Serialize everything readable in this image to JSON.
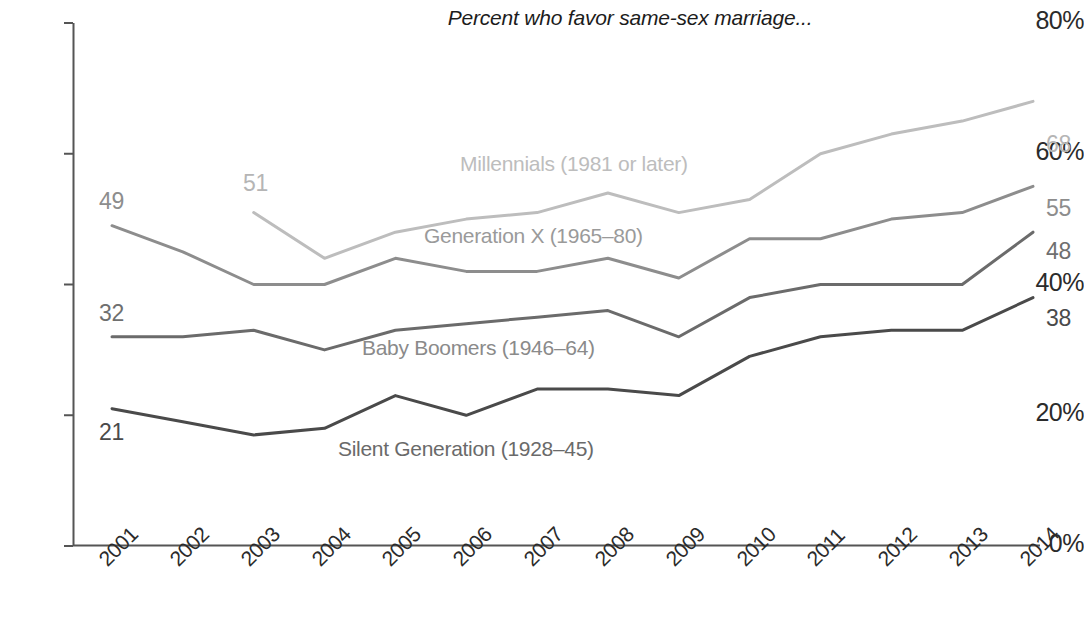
{
  "chart_data": {
    "type": "line",
    "title": "Percent who favor same-sex marriage...",
    "xlabel": "",
    "ylabel": "",
    "ylim": [
      0,
      80
    ],
    "grid": false,
    "legend_position": "inline-labels",
    "categories": [
      "2001",
      "2002",
      "2003",
      "2004",
      "2005",
      "2006",
      "2007",
      "2008",
      "2009",
      "2010",
      "2011",
      "2012",
      "2013",
      "2014"
    ],
    "y_ticks": [
      "0%",
      "20%",
      "40%",
      "60%",
      "80%"
    ],
    "y_tick_values": [
      0,
      20,
      40,
      60,
      80
    ],
    "series": [
      {
        "name": "Millennials (1981 or later)",
        "color": "#bdbdbd",
        "start_label": "51",
        "end_label": "68",
        "values": [
          null,
          null,
          51,
          44,
          48,
          50,
          51,
          54,
          51,
          53,
          60,
          63,
          65,
          68
        ]
      },
      {
        "name": "Generation X (1965–80)",
        "color": "#8d8d8d",
        "start_label": "49",
        "end_label": "55",
        "values": [
          49,
          45,
          40,
          40,
          44,
          42,
          42,
          44,
          41,
          47,
          47,
          50,
          51,
          55
        ]
      },
      {
        "name": "Baby Boomers (1946–64)",
        "color": "#6b6b6b",
        "start_label": "32",
        "end_label": "48",
        "values": [
          32,
          32,
          33,
          30,
          33,
          34,
          35,
          36,
          32,
          38,
          40,
          40,
          40,
          48
        ]
      },
      {
        "name": "Silent Generation (1928–45)",
        "color": "#4a4a4a",
        "start_label": "21",
        "end_label": "38",
        "values": [
          21,
          19,
          17,
          18,
          23,
          20,
          24,
          24,
          23,
          29,
          32,
          33,
          33,
          38
        ]
      }
    ]
  },
  "labels": {
    "millennials_name": "Millennials (1981 or later)",
    "genx_name": "Generation X (1965–80)",
    "boomers_name": "Baby Boomers (1946–64)",
    "silent_name": "Silent Generation (1928–45)",
    "millennials_start": "51",
    "millennials_end": "68",
    "genx_start": "49",
    "genx_end": "55",
    "boomers_start": "32",
    "boomers_end": "48",
    "silent_start": "21",
    "silent_end": "38"
  },
  "axes": {
    "y0": "0%",
    "y20": "20%",
    "y40": "40%",
    "y60": "60%",
    "y80": "80%",
    "x2001": "2001",
    "x2002": "2002",
    "x2003": "2003",
    "x2004": "2004",
    "x2005": "2005",
    "x2006": "2006",
    "x2007": "2007",
    "x2008": "2008",
    "x2009": "2009",
    "x2010": "2010",
    "x2011": "2011",
    "x2012": "2012",
    "x2013": "2013",
    "x2014": "2014"
  }
}
